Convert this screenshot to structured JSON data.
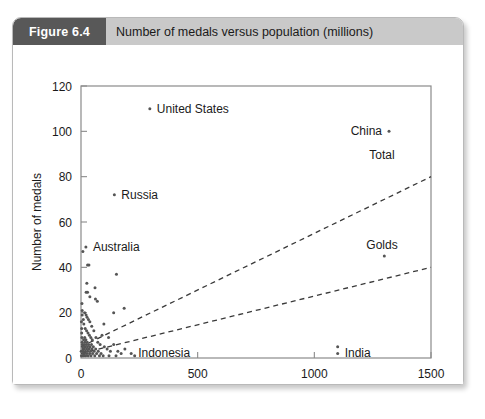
{
  "figure": {
    "number_label": "Figure 6.4",
    "title": "Number of medals versus population (millions)"
  },
  "colors": {
    "badge_bg": "#585858",
    "header_bg": "#c9c9c9",
    "card_bg": "#ffffff",
    "axis": "#8a8a8a",
    "point": "#555555",
    "trend": "#3a3a3a",
    "text": "#1a1a1a"
  },
  "chart_data": {
    "type": "scatter",
    "title": "Number of medals versus population (millions)",
    "xlabel": "Population (millions)",
    "ylabel": "Number of medals",
    "xlim": [
      0,
      1500
    ],
    "ylim": [
      0,
      120
    ],
    "xticks": [
      0,
      500,
      1000,
      1500
    ],
    "yticks": [
      0,
      20,
      40,
      60,
      80,
      100,
      120
    ],
    "xtick_labels": [
      "0",
      "500",
      "1000",
      "1500"
    ],
    "ytick_labels": [
      "0",
      "20",
      "40",
      "60",
      "80",
      "100",
      "120"
    ],
    "grid": false,
    "legend": "inline-right",
    "points": [
      {
        "x": 295,
        "y": 110,
        "label": "United States",
        "label_pos": "right"
      },
      {
        "x": 1320,
        "y": 100,
        "label": "China",
        "label_pos": "left"
      },
      {
        "x": 143,
        "y": 72,
        "label": "Russia",
        "label_pos": "right"
      },
      {
        "x": 21,
        "y": 49,
        "label": "Australia",
        "label_pos": "right"
      },
      {
        "x": 215,
        "y": 2,
        "label": "Indonesia",
        "label_pos": "right"
      },
      {
        "x": 1100,
        "y": 2,
        "label": "India",
        "label_pos": "right"
      },
      {
        "x": 1100,
        "y": 5,
        "label": "",
        "label_pos": ""
      },
      {
        "x": 8,
        "y": 47,
        "label": "",
        "label_pos": ""
      },
      {
        "x": 28,
        "y": 41,
        "label": "",
        "label_pos": ""
      },
      {
        "x": 34,
        "y": 41,
        "label": "",
        "label_pos": ""
      },
      {
        "x": 152,
        "y": 37,
        "label": "",
        "label_pos": ""
      },
      {
        "x": 1300,
        "y": 45,
        "label": "",
        "label_pos": ""
      },
      {
        "x": 25,
        "y": 33,
        "label": "",
        "label_pos": ""
      },
      {
        "x": 22,
        "y": 29,
        "label": "",
        "label_pos": ""
      },
      {
        "x": 28,
        "y": 29,
        "label": "",
        "label_pos": ""
      },
      {
        "x": 62,
        "y": 26,
        "label": "",
        "label_pos": ""
      },
      {
        "x": 70,
        "y": 25,
        "label": "",
        "label_pos": ""
      },
      {
        "x": 4,
        "y": 24,
        "label": "",
        "label_pos": ""
      },
      {
        "x": 60,
        "y": 31,
        "label": "",
        "label_pos": ""
      },
      {
        "x": 38,
        "y": 27,
        "label": "",
        "label_pos": ""
      },
      {
        "x": 5,
        "y": 21,
        "label": "",
        "label_pos": ""
      },
      {
        "x": 5,
        "y": 19,
        "label": "",
        "label_pos": ""
      },
      {
        "x": 16,
        "y": 20,
        "label": "",
        "label_pos": ""
      },
      {
        "x": 22,
        "y": 19,
        "label": "",
        "label_pos": ""
      },
      {
        "x": 26,
        "y": 18,
        "label": "",
        "label_pos": ""
      },
      {
        "x": 32,
        "y": 17,
        "label": "",
        "label_pos": ""
      },
      {
        "x": 38,
        "y": 16,
        "label": "",
        "label_pos": ""
      },
      {
        "x": 46,
        "y": 14,
        "label": "",
        "label_pos": ""
      },
      {
        "x": 10,
        "y": 17,
        "label": "",
        "label_pos": ""
      },
      {
        "x": 12,
        "y": 15,
        "label": "",
        "label_pos": ""
      },
      {
        "x": 18,
        "y": 13,
        "label": "",
        "label_pos": ""
      },
      {
        "x": 24,
        "y": 12,
        "label": "",
        "label_pos": ""
      },
      {
        "x": 30,
        "y": 11,
        "label": "",
        "label_pos": ""
      },
      {
        "x": 36,
        "y": 10,
        "label": "",
        "label_pos": ""
      },
      {
        "x": 42,
        "y": 9,
        "label": "",
        "label_pos": ""
      },
      {
        "x": 48,
        "y": 8,
        "label": "",
        "label_pos": ""
      },
      {
        "x": 55,
        "y": 12,
        "label": "",
        "label_pos": ""
      },
      {
        "x": 64,
        "y": 9,
        "label": "",
        "label_pos": ""
      },
      {
        "x": 72,
        "y": 7,
        "label": "",
        "label_pos": ""
      },
      {
        "x": 82,
        "y": 6,
        "label": "",
        "label_pos": ""
      },
      {
        "x": 90,
        "y": 10,
        "label": "",
        "label_pos": ""
      },
      {
        "x": 100,
        "y": 5,
        "label": "",
        "label_pos": ""
      },
      {
        "x": 112,
        "y": 4,
        "label": "",
        "label_pos": ""
      },
      {
        "x": 126,
        "y": 3,
        "label": "",
        "label_pos": ""
      },
      {
        "x": 140,
        "y": 6,
        "label": "",
        "label_pos": ""
      },
      {
        "x": 158,
        "y": 3,
        "label": "",
        "label_pos": ""
      },
      {
        "x": 172,
        "y": 2,
        "label": "",
        "label_pos": ""
      },
      {
        "x": 188,
        "y": 4,
        "label": "",
        "label_pos": ""
      },
      {
        "x": 2,
        "y": 16,
        "label": "",
        "label_pos": ""
      },
      {
        "x": 3,
        "y": 13,
        "label": "",
        "label_pos": ""
      },
      {
        "x": 3,
        "y": 11,
        "label": "",
        "label_pos": ""
      },
      {
        "x": 4,
        "y": 9,
        "label": "",
        "label_pos": ""
      },
      {
        "x": 5,
        "y": 7,
        "label": "",
        "label_pos": ""
      },
      {
        "x": 6,
        "y": 6,
        "label": "",
        "label_pos": ""
      },
      {
        "x": 7,
        "y": 5,
        "label": "",
        "label_pos": ""
      },
      {
        "x": 8,
        "y": 4,
        "label": "",
        "label_pos": ""
      },
      {
        "x": 9,
        "y": 3,
        "label": "",
        "label_pos": ""
      },
      {
        "x": 10,
        "y": 2,
        "label": "",
        "label_pos": ""
      },
      {
        "x": 11,
        "y": 8,
        "label": "",
        "label_pos": ""
      },
      {
        "x": 13,
        "y": 6,
        "label": "",
        "label_pos": ""
      },
      {
        "x": 14,
        "y": 4,
        "label": "",
        "label_pos": ""
      },
      {
        "x": 15,
        "y": 2,
        "label": "",
        "label_pos": ""
      },
      {
        "x": 16,
        "y": 9,
        "label": "",
        "label_pos": ""
      },
      {
        "x": 17,
        "y": 7,
        "label": "",
        "label_pos": ""
      },
      {
        "x": 18,
        "y": 5,
        "label": "",
        "label_pos": ""
      },
      {
        "x": 19,
        "y": 3,
        "label": "",
        "label_pos": ""
      },
      {
        "x": 20,
        "y": 1,
        "label": "",
        "label_pos": ""
      },
      {
        "x": 21,
        "y": 8,
        "label": "",
        "label_pos": ""
      },
      {
        "x": 23,
        "y": 6,
        "label": "",
        "label_pos": ""
      },
      {
        "x": 24,
        "y": 4,
        "label": "",
        "label_pos": ""
      },
      {
        "x": 25,
        "y": 2,
        "label": "",
        "label_pos": ""
      },
      {
        "x": 27,
        "y": 7,
        "label": "",
        "label_pos": ""
      },
      {
        "x": 28,
        "y": 5,
        "label": "",
        "label_pos": ""
      },
      {
        "x": 29,
        "y": 3,
        "label": "",
        "label_pos": ""
      },
      {
        "x": 31,
        "y": 1,
        "label": "",
        "label_pos": ""
      },
      {
        "x": 33,
        "y": 6,
        "label": "",
        "label_pos": ""
      },
      {
        "x": 35,
        "y": 4,
        "label": "",
        "label_pos": ""
      },
      {
        "x": 37,
        "y": 2,
        "label": "",
        "label_pos": ""
      },
      {
        "x": 39,
        "y": 5,
        "label": "",
        "label_pos": ""
      },
      {
        "x": 41,
        "y": 3,
        "label": "",
        "label_pos": ""
      },
      {
        "x": 43,
        "y": 1,
        "label": "",
        "label_pos": ""
      },
      {
        "x": 45,
        "y": 6,
        "label": "",
        "label_pos": ""
      },
      {
        "x": 47,
        "y": 4,
        "label": "",
        "label_pos": ""
      },
      {
        "x": 50,
        "y": 2,
        "label": "",
        "label_pos": ""
      },
      {
        "x": 53,
        "y": 5,
        "label": "",
        "label_pos": ""
      },
      {
        "x": 56,
        "y": 3,
        "label": "",
        "label_pos": ""
      },
      {
        "x": 59,
        "y": 1,
        "label": "",
        "label_pos": ""
      },
      {
        "x": 63,
        "y": 4,
        "label": "",
        "label_pos": ""
      },
      {
        "x": 67,
        "y": 2,
        "label": "",
        "label_pos": ""
      },
      {
        "x": 74,
        "y": 3,
        "label": "",
        "label_pos": ""
      },
      {
        "x": 79,
        "y": 1,
        "label": "",
        "label_pos": ""
      },
      {
        "x": 86,
        "y": 2,
        "label": "",
        "label_pos": ""
      },
      {
        "x": 95,
        "y": 1,
        "label": "",
        "label_pos": ""
      },
      {
        "x": 1,
        "y": 3,
        "label": "",
        "label_pos": ""
      },
      {
        "x": 2,
        "y": 1,
        "label": "",
        "label_pos": ""
      },
      {
        "x": 6,
        "y": 1,
        "label": "",
        "label_pos": ""
      },
      {
        "x": 12,
        "y": 1,
        "label": "",
        "label_pos": ""
      },
      {
        "x": 120,
        "y": 1,
        "label": "",
        "label_pos": ""
      },
      {
        "x": 150,
        "y": 1,
        "label": "",
        "label_pos": ""
      },
      {
        "x": 230,
        "y": 1,
        "label": "",
        "label_pos": ""
      },
      {
        "x": 185,
        "y": 22,
        "label": "",
        "label_pos": ""
      },
      {
        "x": 140,
        "y": 20,
        "label": "",
        "label_pos": ""
      },
      {
        "x": 98,
        "y": 15,
        "label": "",
        "label_pos": ""
      },
      {
        "x": 118,
        "y": 9,
        "label": "",
        "label_pos": ""
      }
    ],
    "series": [
      {
        "name": "Total",
        "type": "trend-dashed",
        "x0": 0,
        "y0": 5,
        "x1": 1500,
        "y1": 80,
        "label_x": 1290,
        "label_y": 88
      },
      {
        "name": "Golds",
        "type": "trend-dashed",
        "x0": 0,
        "y0": 2,
        "x1": 1500,
        "y1": 40,
        "label_x": 1290,
        "label_y": 48
      }
    ]
  }
}
